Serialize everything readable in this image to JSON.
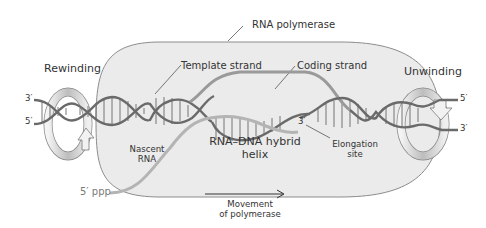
{
  "labels": {
    "rna_polymerase": "RNA polymerase",
    "template_strand": "Template strand",
    "coding_strand": "Coding strand",
    "rewinding": "Rewinding",
    "unwinding": "Unwinding",
    "nascent_rna_1": "Nascent",
    "nascent_rna_2": "RNA",
    "hybrid_1": "RNA–DNA hybrid",
    "hybrid_2": "helix",
    "elongation_1": "Elongation",
    "elongation_2": "site",
    "movement_1": "Movement",
    "movement_2": "of polymerase",
    "five_ppp": "5′ ppp",
    "left_3": "3′",
    "left_5": "5′",
    "right_5": "5′",
    "right_3": "3′",
    "rna_3": "3′"
  },
  "colors": {
    "polymerase_fill": "#ebebeb",
    "polymerase_stroke": "#8c8c8c",
    "dna_strand": "#6e6e6e",
    "rna_strand": "#b4b4b4",
    "rung": "#555555",
    "arrow_band": "#d0d0d0",
    "text": "#333333"
  }
}
